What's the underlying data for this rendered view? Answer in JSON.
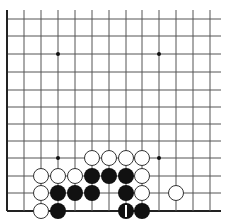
{
  "board": {
    "description": "Go board fragment (lower-left region), 13 visible columns x 12 visible rows",
    "cols": 13,
    "rows": 12,
    "col_x": [
      7,
      24,
      41,
      58,
      75,
      92,
      109,
      126,
      142,
      159,
      176,
      193,
      210
    ],
    "row_y": [
      19,
      36,
      54,
      72,
      90,
      107,
      124,
      141,
      158,
      176,
      193,
      211
    ],
    "right_extent": 221,
    "top_extent": 10,
    "edges": {
      "left": true,
      "bottom": true,
      "top": false,
      "right": false
    },
    "star_points": [
      [
        3,
        2
      ],
      [
        9,
        2
      ],
      [
        3,
        8
      ],
      [
        9,
        8
      ]
    ],
    "stone_radius": 8,
    "colors": {
      "line": "#555555",
      "edge": "#222222",
      "black": "#111111",
      "white": "#ffffff",
      "white_outline": "#333333",
      "marker": "#ffffff"
    }
  },
  "stones": [
    {
      "col": 5,
      "row": 8,
      "color": "white"
    },
    {
      "col": 6,
      "row": 8,
      "color": "white"
    },
    {
      "col": 7,
      "row": 8,
      "color": "white"
    },
    {
      "col": 8,
      "row": 8,
      "color": "white"
    },
    {
      "col": 2,
      "row": 9,
      "color": "white"
    },
    {
      "col": 3,
      "row": 9,
      "color": "white"
    },
    {
      "col": 4,
      "row": 9,
      "color": "white"
    },
    {
      "col": 5,
      "row": 9,
      "color": "black"
    },
    {
      "col": 6,
      "row": 9,
      "color": "black"
    },
    {
      "col": 7,
      "row": 9,
      "color": "black"
    },
    {
      "col": 8,
      "row": 9,
      "color": "white"
    },
    {
      "col": 2,
      "row": 10,
      "color": "white"
    },
    {
      "col": 3,
      "row": 10,
      "color": "black"
    },
    {
      "col": 4,
      "row": 10,
      "color": "black"
    },
    {
      "col": 5,
      "row": 10,
      "color": "black"
    },
    {
      "col": 7,
      "row": 10,
      "color": "black"
    },
    {
      "col": 8,
      "row": 10,
      "color": "white"
    },
    {
      "col": 10,
      "row": 10,
      "color": "white"
    },
    {
      "col": 2,
      "row": 11,
      "color": "white"
    },
    {
      "col": 3,
      "row": 11,
      "color": "black"
    },
    {
      "col": 7,
      "row": 11,
      "color": "black",
      "label": "1"
    },
    {
      "col": 8,
      "row": 11,
      "color": "black"
    }
  ]
}
